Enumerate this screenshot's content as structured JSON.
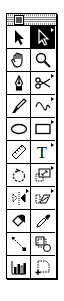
{
  "palette": {
    "title": "",
    "close_label": "close",
    "tools": [
      {
        "name": "selection-tool",
        "icon": "arrow-icon",
        "selected": false,
        "has_submenu": false
      },
      {
        "name": "direct-selection-tool",
        "icon": "hollow-arrow-icon",
        "selected": true,
        "has_submenu": true
      },
      {
        "name": "hand-tool",
        "icon": "hand-icon",
        "selected": false,
        "has_submenu": false
      },
      {
        "name": "zoom-tool",
        "icon": "magnifier-icon",
        "selected": false,
        "has_submenu": false
      },
      {
        "name": "pen-tool",
        "icon": "pen-nib-icon",
        "selected": false,
        "has_submenu": false
      },
      {
        "name": "scissors-tool",
        "icon": "scissors-icon",
        "selected": false,
        "has_submenu": true
      },
      {
        "name": "brush-tool",
        "icon": "brush-icon",
        "selected": false,
        "has_submenu": false
      },
      {
        "name": "freehand-tool",
        "icon": "squiggle-icon",
        "selected": false,
        "has_submenu": true
      },
      {
        "name": "oval-tool",
        "icon": "ellipse-icon",
        "selected": false,
        "has_submenu": false
      },
      {
        "name": "rectangle-tool",
        "icon": "rectangle-icon",
        "selected": false,
        "has_submenu": true
      },
      {
        "name": "measure-tool",
        "icon": "ruler-icon",
        "selected": false,
        "has_submenu": false
      },
      {
        "name": "type-tool",
        "icon": "type-t-icon",
        "selected": false,
        "has_submenu": true
      },
      {
        "name": "rotate-tool",
        "icon": "rotate-icon",
        "selected": false,
        "has_submenu": false
      },
      {
        "name": "scale-tool",
        "icon": "scale-icon",
        "selected": false,
        "has_submenu": true
      },
      {
        "name": "reflect-tool",
        "icon": "reflect-icon",
        "selected": false,
        "has_submenu": true
      },
      {
        "name": "shear-tool",
        "icon": "shear-icon",
        "selected": false,
        "has_submenu": true
      },
      {
        "name": "paint-bucket-tool",
        "icon": "paint-bucket-icon",
        "selected": false,
        "has_submenu": false
      },
      {
        "name": "eyedropper-tool",
        "icon": "eyedropper-icon",
        "selected": false,
        "has_submenu": false
      },
      {
        "name": "blend-tool",
        "icon": "blend-icon",
        "selected": false,
        "has_submenu": false
      },
      {
        "name": "autotrace-tool",
        "icon": "autotrace-icon",
        "selected": false,
        "has_submenu": false
      },
      {
        "name": "graph-tool",
        "icon": "bar-graph-icon",
        "selected": false,
        "has_submenu": false
      },
      {
        "name": "page-tool",
        "icon": "page-marquee-icon",
        "selected": false,
        "has_submenu": false
      }
    ]
  }
}
